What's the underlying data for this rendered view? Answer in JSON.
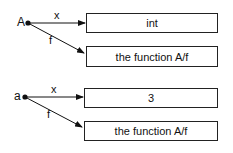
{
  "groups": [
    {
      "object": "A",
      "edges": [
        {
          "label": "x",
          "target": "int"
        },
        {
          "label": "f",
          "target": "the function A/f"
        }
      ]
    },
    {
      "object": "a",
      "edges": [
        {
          "label": "x",
          "target": "3"
        },
        {
          "label": "f",
          "target": "the function A/f"
        }
      ]
    }
  ]
}
